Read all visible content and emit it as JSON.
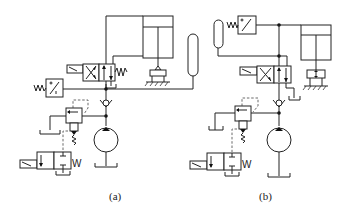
{
  "figure": {
    "type": "hydraulic circuit diagram",
    "panels": [
      {
        "id": "a",
        "label": "(a)",
        "components": [
          "hydraulic-cylinder",
          "clamp-workpiece",
          "4-2-solenoid-directional-valve",
          "pressure-switch",
          "check-valve",
          "accumulator",
          "pilot-relief-valve",
          "2-2-solenoid-valve",
          "pump",
          "tank"
        ]
      },
      {
        "id": "b",
        "label": "(b)",
        "components": [
          "hydraulic-cylinder",
          "clamp-workpiece",
          "4-2-solenoid-directional-valve",
          "pressure-switch",
          "check-valve",
          "accumulator",
          "pilot-relief-valve",
          "2-2-solenoid-valve",
          "pump",
          "tank"
        ]
      }
    ],
    "symbols": {
      "spring_glyph": "W",
      "solenoid_glyph": "/"
    }
  },
  "colors": {
    "line": "#222222",
    "background": "#ffffff"
  }
}
